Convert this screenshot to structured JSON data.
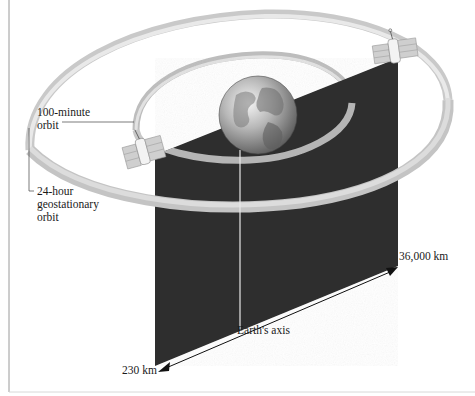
{
  "figure": {
    "type": "orbit-comparison-diagram",
    "labels": {
      "low_orbit": [
        "100-minute",
        "orbit"
      ],
      "geo_orbit": [
        "24-hour",
        "geostationary",
        "orbit"
      ],
      "outer_distance": "36,000 km",
      "axis": "Earth's axis",
      "inner_distance": "230 km"
    },
    "elements": {
      "earth": "globe",
      "satellites": [
        "satellite-on-100-minute-orbit",
        "satellite-on-geostationary-orbit"
      ],
      "plane": "equatorial-cross-section-panel"
    },
    "colors": {
      "panel": "#2f2f2f",
      "ring": "#bdbdbd",
      "ring_shadow": "#8a8a8a",
      "text": "#1a1a1a",
      "frame": "#9a9a9a"
    }
  }
}
